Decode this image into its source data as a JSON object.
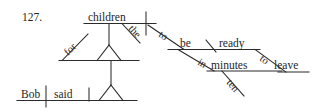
{
  "figure": {
    "item_number": "127.",
    "type": "reed-kellogg-sentence-diagram"
  },
  "words": {
    "bob": "Bob",
    "said": "said",
    "children": "children",
    "the": "the",
    "for": "for",
    "to_1": "to",
    "be": "be",
    "ready": "ready",
    "in": "in",
    "minutes": "minutes",
    "ten": "ten",
    "to_2": "to",
    "leave": "leave"
  },
  "colors": {
    "ink": "#2b2b2b",
    "text": "#262626",
    "background": "#ffffff"
  }
}
